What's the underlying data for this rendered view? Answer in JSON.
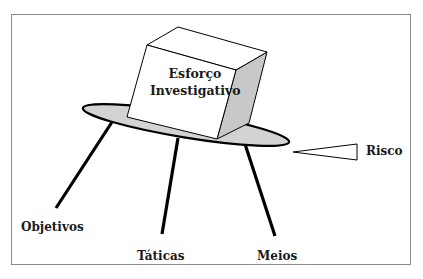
{
  "diagram": {
    "central_box": {
      "line1": "Esforço",
      "line2": "Investigativo"
    },
    "legs": [
      {
        "label": "Objetivos"
      },
      {
        "label": "Táticas"
      },
      {
        "label": "Meios"
      }
    ],
    "risk": {
      "label": "Risco"
    },
    "colors": {
      "table_fill": "#d3d3d3",
      "box_side_fill": "#c8c8c8",
      "box_face_fill": "#ffffff",
      "stroke": "#000000",
      "frame": "#8a8a8a"
    }
  }
}
